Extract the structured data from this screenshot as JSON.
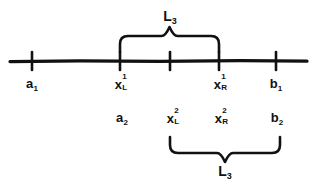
{
  "figure": {
    "background_color": "#ffffff",
    "ink_color": "#111111",
    "axis": {
      "label": "number-line",
      "y": 61,
      "x_start": 10,
      "x_end": 307,
      "stroke_width": 3.2,
      "ticks": [
        {
          "name": "tick-a1",
          "x": 32
        },
        {
          "name": "tick-xL1",
          "x": 120
        },
        {
          "name": "tick-mid",
          "x": 170
        },
        {
          "name": "tick-xR1",
          "x": 219
        },
        {
          "name": "tick-b1",
          "x": 276
        }
      ]
    },
    "braces": [
      {
        "name": "top-brace",
        "orientation": "down",
        "x_left": 120,
        "x_right": 219,
        "label": "L",
        "label_sub": "3",
        "label_x": 170,
        "label_y": 8
      },
      {
        "name": "bottom-brace",
        "orientation": "up",
        "x_left": 170,
        "x_right": 280,
        "label": "L",
        "label_sub": "3",
        "label_x": 225,
        "label_y": 163
      }
    ],
    "row1": {
      "name": "interval-1-labels",
      "y": 76,
      "labels": [
        {
          "name": "label-a1",
          "base": "a",
          "sub": "1",
          "sup": "",
          "x": 32
        },
        {
          "name": "label-xL1",
          "base": "x",
          "sub": "L",
          "sup": "1",
          "x": 122
        },
        {
          "name": "label-xR1",
          "base": "x",
          "sub": "R",
          "sup": "1",
          "x": 221
        },
        {
          "name": "label-b1",
          "base": "b",
          "sub": "1",
          "sup": "",
          "x": 276
        }
      ]
    },
    "row2": {
      "name": "interval-2-labels",
      "y": 110,
      "labels": [
        {
          "name": "label-a2",
          "base": "a",
          "sub": "2",
          "sup": "",
          "x": 122
        },
        {
          "name": "label-xL2",
          "base": "x",
          "sub": "L",
          "sup": "2",
          "x": 174
        },
        {
          "name": "label-xR2",
          "base": "x",
          "sub": "R",
          "sup": "2",
          "x": 222
        },
        {
          "name": "label-b2",
          "base": "b",
          "sub": "2",
          "sup": "",
          "x": 277
        }
      ]
    }
  }
}
